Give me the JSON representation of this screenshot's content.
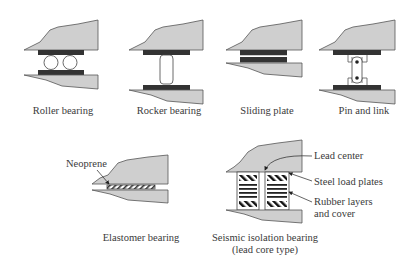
{
  "colors": {
    "block_fill": "#cfcfcf",
    "block_stroke": "#555555",
    "plate_fill": "#333333",
    "text": "#3a3a3a"
  },
  "diagrams": [
    {
      "id": "roller",
      "label": "Roller bearing"
    },
    {
      "id": "rocker",
      "label": "Rocker bearing"
    },
    {
      "id": "sliding",
      "label": "Sliding plate"
    },
    {
      "id": "pin-link",
      "label": "Pin and link"
    },
    {
      "id": "elastomer",
      "label": "Elastomer bearing",
      "callouts": [
        "Neoprene"
      ]
    },
    {
      "id": "seismic",
      "label_line1": "Seismic isolation bearing",
      "label_line2": "(lead core type)",
      "callouts": [
        "Lead center",
        "Steel load plates",
        "Rubber layers",
        "and cover"
      ]
    }
  ]
}
